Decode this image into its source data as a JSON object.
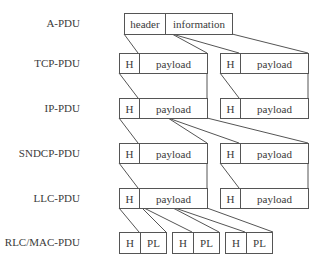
{
  "diagram": {
    "rows": [
      {
        "label": "A-PDU"
      },
      {
        "label": "TCP-PDU"
      },
      {
        "label": "IP-PDU"
      },
      {
        "label": "SNDCP-PDU"
      },
      {
        "label": "LLC-PDU"
      },
      {
        "label": "RLC/MAC-PDU"
      }
    ],
    "apdu": {
      "header": "header",
      "information": "information"
    },
    "h": "H",
    "payload": "payload",
    "pl": "PL",
    "line_color": "#555555"
  }
}
